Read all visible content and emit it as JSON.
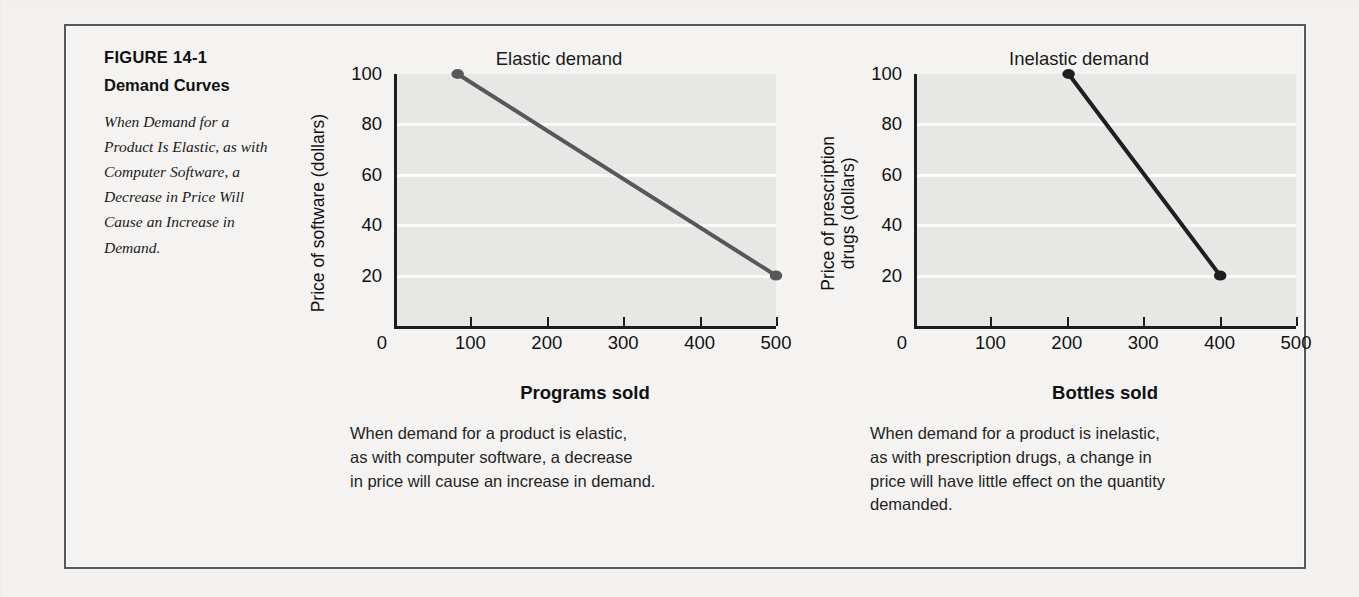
{
  "figure": {
    "number": "FIGURE 14-1",
    "title": "Demand Curves",
    "description": "When Demand for a Product Is Elastic, as with Computer Software, a Decrease in Price Will Cause an Increase in Demand."
  },
  "charts": [
    {
      "title": "Elastic demand",
      "ylabel_lines": [
        "Price of software (dollars)"
      ],
      "xlabel": "Bottles sold placeholder",
      "caption_lines": [
        "When demand for a product is elastic,",
        "as with computer software, a decrease",
        "in price will cause an increase in demand."
      ]
    }
  ],
  "chart_data": [
    {
      "type": "line",
      "title": "Elastic demand",
      "xlabel": "Programs sold",
      "ylabel": "Price of software (dollars)",
      "ylabel_lines": [
        "Price of software (dollars)"
      ],
      "xlim": [
        0,
        500
      ],
      "ylim": [
        0,
        100
      ],
      "xticks": [
        0,
        100,
        200,
        300,
        400,
        500
      ],
      "xtick_labels": [
        "0",
        "100",
        "200",
        "300",
        "400",
        "500"
      ],
      "yticks": [
        20,
        40,
        60,
        80,
        100
      ],
      "ytick_labels": [
        "20",
        "40",
        "60",
        "80",
        "100"
      ],
      "gridlines_y": [
        20,
        40,
        60,
        80
      ],
      "grid": true,
      "legend": "none",
      "line_color": "#585858",
      "series": [
        {
          "name": "Demand curve (elastic)",
          "x": [
            80,
            500
          ],
          "y": [
            100,
            20
          ],
          "markers": [
            {
              "x": 80,
              "y": 100
            },
            {
              "x": 500,
              "y": 20
            }
          ]
        }
      ],
      "caption_lines": [
        "When demand for a product is elastic,",
        "as with computer software, a decrease",
        "in price will cause an increase in demand."
      ]
    },
    {
      "type": "line",
      "title": "Inelastic demand",
      "xlabel": "Bottles sold",
      "ylabel": "Price of prescription drugs (dollars)",
      "ylabel_lines": [
        "Price of prescription",
        "drugs (dollars)"
      ],
      "xlim": [
        0,
        500
      ],
      "ylim": [
        0,
        100
      ],
      "xticks": [
        0,
        100,
        200,
        300,
        400,
        500
      ],
      "xtick_labels": [
        "0",
        "100",
        "200",
        "300",
        "400",
        "500"
      ],
      "yticks": [
        20,
        40,
        60,
        80,
        100
      ],
      "ytick_labels": [
        "20",
        "40",
        "60",
        "80",
        "100"
      ],
      "gridlines_y": [
        20,
        40,
        60,
        80
      ],
      "grid": true,
      "legend": "none",
      "line_color": "#1f1f1f",
      "series": [
        {
          "name": "Demand curve (inelastic)",
          "x": [
            200,
            400
          ],
          "y": [
            100,
            20
          ],
          "markers": [
            {
              "x": 200,
              "y": 100
            },
            {
              "x": 400,
              "y": 20
            }
          ]
        }
      ],
      "caption_lines": [
        "When demand for a product is inelastic,",
        "as with prescription drugs, a change in",
        "price will have little effect on the quantity",
        "demanded."
      ]
    }
  ],
  "colors": {
    "page_background": "#f2f1ef",
    "frame_border": "#585858",
    "plot_background": "#e7e7e5",
    "gridline": "#fbfbfa",
    "axis": "#1d1d1d",
    "elastic_line": "#585858",
    "inelastic_line": "#1f1f1f"
  }
}
